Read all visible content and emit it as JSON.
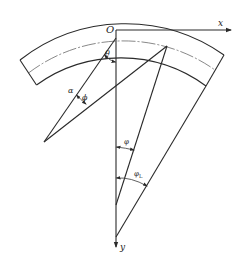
{
  "diagram": {
    "type": "geometric-schematic",
    "axes": {
      "origin_label": "O",
      "x_label": "x",
      "y_label": "y"
    },
    "angle_labels": {
      "theta": "θ",
      "alpha": "α",
      "phi_small": "ϕ",
      "phi": "φ",
      "phi_L": "φ",
      "phi_L_sub": "L"
    }
  }
}
